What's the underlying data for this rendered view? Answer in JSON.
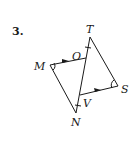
{
  "problem": {
    "number": "3."
  },
  "points": {
    "T": {
      "label": "T",
      "x": 90,
      "y": 37
    },
    "O": {
      "label": "O",
      "x": 86,
      "y": 58
    },
    "M": {
      "label": "M",
      "x": 50,
      "y": 65
    },
    "S": {
      "label": "S",
      "x": 118,
      "y": 86
    },
    "V": {
      "label": "V",
      "x": 80,
      "y": 95
    },
    "N": {
      "label": "N",
      "x": 76,
      "y": 113
    }
  },
  "segments": [
    "MO",
    "MN",
    "TN",
    "TS",
    "VS"
  ],
  "markings": {
    "parallel_arrows": [
      "MO",
      "VS"
    ],
    "congruent_ticks": [
      "TO",
      "VN"
    ],
    "angle_arcs": [
      "M",
      "S"
    ]
  },
  "colors": {
    "stroke": "#1a1a1a",
    "background": "#ffffff"
  }
}
